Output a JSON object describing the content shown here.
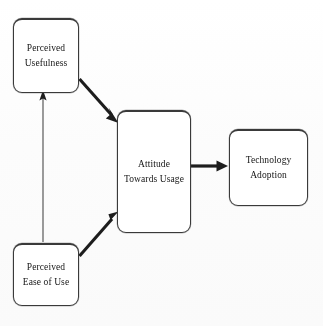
{
  "diagram": {
    "background_color": "#fdfdfd",
    "stroke_color": "#262626",
    "text_color": "#141414",
    "nodes": [
      {
        "id": "perceived-usefulness",
        "lines": [
          "Perceived",
          "Usefulness"
        ],
        "line1": "Perceived",
        "line2": "Usefulness",
        "x": 13,
        "y": 18,
        "w": 66,
        "h": 75
      },
      {
        "id": "perceived-ease-of-use",
        "lines": [
          "Perceived",
          "Ease of Use"
        ],
        "line1": "Perceived",
        "line2": "Ease of Use",
        "x": 13,
        "y": 243,
        "w": 66,
        "h": 63
      },
      {
        "id": "attitude-towards-usage",
        "lines": [
          "Attitude",
          "Towards Usage"
        ],
        "line1": "Attitude",
        "line2": "Towards Usage",
        "x": 117,
        "y": 110,
        "w": 74,
        "h": 123
      },
      {
        "id": "technology-adoption",
        "lines": [
          "Technology",
          "Adoption"
        ],
        "line1": "Technology",
        "line2": "Adoption",
        "x": 229,
        "y": 129,
        "w": 79,
        "h": 77
      }
    ],
    "edges": [
      {
        "id": "peou-to-pu",
        "from": "perceived-ease-of-use",
        "to": "perceived-usefulness",
        "style": "thin-vertical",
        "direction": "up",
        "label": ""
      },
      {
        "id": "pu-to-atu",
        "from": "perceived-usefulness",
        "to": "attitude-towards-usage",
        "style": "thick-diagonal",
        "direction": "down-right",
        "label": ""
      },
      {
        "id": "peou-to-atu",
        "from": "perceived-ease-of-use",
        "to": "attitude-towards-usage",
        "style": "thick-diagonal",
        "direction": "up-right",
        "label": ""
      },
      {
        "id": "atu-to-ta",
        "from": "attitude-towards-usage",
        "to": "technology-adoption",
        "style": "thick-horizontal",
        "direction": "right",
        "label": ""
      }
    ]
  }
}
